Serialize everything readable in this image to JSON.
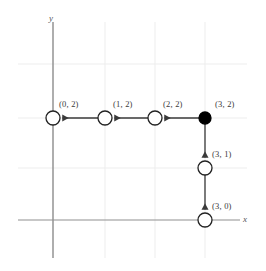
{
  "figure": {
    "type": "graph-path-diagram",
    "background_color": "#ffffff",
    "axis_color": "#808080",
    "grid_color": "#ededed",
    "edge_color": "#3a3a3a",
    "node_stroke_color": "#222222",
    "node_fill_open": "#ffffff",
    "node_fill_visited": "#000000",
    "label_color": "#3a3a3a"
  },
  "axes": {
    "x_axis_label": "x",
    "y_axis_label": "y",
    "x_axis_y_px": 220,
    "y_axis_x_px": 53,
    "grid_spacing_px": 50,
    "grid_x_positions": [
      53,
      105,
      155,
      205
    ],
    "grid_y_positions": [
      64,
      118,
      168,
      220
    ]
  },
  "nodes": [
    {
      "id": "n32",
      "label": "(3, 2)",
      "x": 3,
      "y": 2,
      "cx": 205,
      "cy": 118,
      "r": 6.0,
      "state": "visited",
      "label_dx": 14,
      "label_dy": -18
    },
    {
      "id": "n22",
      "label": "(2, 2)",
      "x": 2,
      "y": 2,
      "cx": 155,
      "cy": 118,
      "r": 7.0,
      "state": "open",
      "label_dx": 8,
      "label_dy": -18
    },
    {
      "id": "n12",
      "label": "(1, 2)",
      "x": 1,
      "y": 2,
      "cx": 105,
      "cy": 118,
      "r": 7.0,
      "state": "open",
      "label_dx": 8,
      "label_dy": -18
    },
    {
      "id": "n02",
      "label": "(0, 2)",
      "x": 0,
      "y": 2,
      "cx": 53,
      "cy": 118,
      "r": 7.0,
      "state": "open",
      "label_dx": 6,
      "label_dy": -18
    },
    {
      "id": "n31",
      "label": "(3, 1)",
      "x": 3,
      "y": 1,
      "cx": 205,
      "cy": 168,
      "r": 7.0,
      "state": "open",
      "label_dx": 11,
      "label_dy": -18
    },
    {
      "id": "n30",
      "label": "(3, 0)",
      "x": 3,
      "y": 0,
      "cx": 205,
      "cy": 220,
      "r": 7.0,
      "state": "open",
      "label_dx": 11,
      "label_dy": -19
    }
  ],
  "edges": [
    {
      "id": "e-32-22",
      "from": "n32",
      "to": "n22",
      "direction": "left"
    },
    {
      "id": "e-22-12",
      "from": "n22",
      "to": "n12",
      "direction": "left"
    },
    {
      "id": "e-12-02",
      "from": "n12",
      "to": "n02",
      "direction": "left"
    },
    {
      "id": "e-32-31",
      "from": "n32",
      "to": "n31",
      "direction": "down"
    },
    {
      "id": "e-31-30",
      "from": "n31",
      "to": "n30",
      "direction": "down"
    }
  ]
}
